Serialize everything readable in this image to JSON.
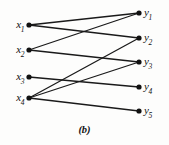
{
  "figure": {
    "caption": "(b)",
    "background_color": "#fdfdfc",
    "edge_color": "#1a1a1a",
    "node_color": "#111111",
    "label_color": "#111111"
  },
  "graph_data": {
    "type": "bipartite-graph",
    "left_nodes": [
      {
        "id": "x1",
        "base": "x",
        "sub": "1",
        "cx": 29,
        "cy": 25
      },
      {
        "id": "x2",
        "base": "x",
        "sub": "2",
        "cx": 29,
        "cy": 50
      },
      {
        "id": "x3",
        "base": "x",
        "sub": "3",
        "cx": 29,
        "cy": 77
      },
      {
        "id": "x4",
        "base": "x",
        "sub": "4",
        "cx": 29,
        "cy": 98
      }
    ],
    "right_nodes": [
      {
        "id": "y1",
        "base": "y",
        "sub": "1",
        "cx": 139,
        "cy": 13
      },
      {
        "id": "y2",
        "base": "y",
        "sub": "2",
        "cx": 139,
        "cy": 38
      },
      {
        "id": "y3",
        "base": "y",
        "sub": "3",
        "cx": 139,
        "cy": 62
      },
      {
        "id": "y4",
        "base": "y",
        "sub": "4",
        "cx": 139,
        "cy": 87
      },
      {
        "id": "y5",
        "base": "y",
        "sub": "5",
        "cx": 139,
        "cy": 111
      }
    ],
    "edges": [
      {
        "from": "x1",
        "to": "y1"
      },
      {
        "from": "x1",
        "to": "y2"
      },
      {
        "from": "x2",
        "to": "y1"
      },
      {
        "from": "x2",
        "to": "y3"
      },
      {
        "from": "x3",
        "to": "y4"
      },
      {
        "from": "x4",
        "to": "y2"
      },
      {
        "from": "x4",
        "to": "y3"
      },
      {
        "from": "x4",
        "to": "y5"
      }
    ],
    "node_radius": 2.6,
    "edge_width": 1.3
  }
}
